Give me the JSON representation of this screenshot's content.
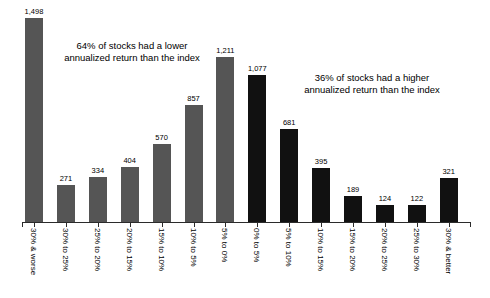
{
  "chart_data": {
    "type": "bar",
    "title": "",
    "xlabel": "",
    "ylabel": "",
    "ylim": [
      0,
      1498
    ],
    "grid": false,
    "legend": "none",
    "categories": [
      "30% & worse",
      "30% to 25%",
      "25% to 20%",
      "20% to 15%",
      "15% to 10%",
      "10% to 5%",
      "5% to 0%",
      "0% to 5%",
      "5% to 10%",
      "10% to 15%",
      "15% to 20%",
      "20% to 25%",
      "25% to 30%",
      "30% & better"
    ],
    "values": [
      1498,
      271,
      334,
      404,
      570,
      857,
      1211,
      1077,
      681,
      395,
      189,
      124,
      122,
      321
    ],
    "value_labels": [
      "1,498",
      "271",
      "334",
      "404",
      "570",
      "857",
      "1,211",
      "1,077",
      "681",
      "395",
      "189",
      "124",
      "122",
      "321"
    ],
    "bar_colors": [
      "#555555",
      "#555555",
      "#555555",
      "#555555",
      "#555555",
      "#555555",
      "#555555",
      "#111111",
      "#111111",
      "#111111",
      "#111111",
      "#111111",
      "#111111",
      "#111111"
    ],
    "annotations": [
      {
        "id": "left",
        "text": "64% of stocks had a lower\nannualized return than the index"
      },
      {
        "id": "right",
        "text": "36% of stocks had a higher\nannualized return than the index"
      }
    ],
    "colors": {
      "underperform": "#555555",
      "outperform": "#111111",
      "axis": "#2b2b2b",
      "background": "#ffffff",
      "text": "#000000"
    }
  }
}
